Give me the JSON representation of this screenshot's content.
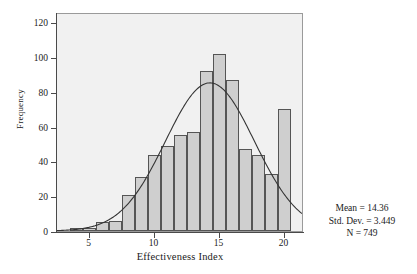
{
  "chart_data": {
    "type": "bar",
    "title": "",
    "subtitle": "",
    "xlabel": "Effectiveness Index",
    "ylabel": "Frequency",
    "xlim": [
      2.5,
      21.5
    ],
    "ylim": [
      0,
      126
    ],
    "grid": false,
    "legend": null,
    "bin_width": 1,
    "categories": [
      4,
      5,
      6,
      7,
      8,
      9,
      10,
      11,
      12,
      13,
      14,
      15,
      16,
      17,
      18,
      19,
      20
    ],
    "values": [
      2,
      2,
      5,
      6,
      21,
      31,
      44,
      49,
      55,
      57,
      92,
      102,
      87,
      47,
      44,
      33,
      70
    ],
    "xticks": [
      5,
      10,
      15,
      20
    ],
    "yticks": [
      0,
      20,
      40,
      60,
      80,
      100,
      120
    ],
    "overlay": {
      "type": "line",
      "name": "normal-curve",
      "mean": 14.36,
      "std_dev": 3.449,
      "n": 749,
      "peak_value": 86
    },
    "annotations": [
      "Mean = 14.36",
      "Std. Dev. = 3.449",
      "N = 749"
    ]
  },
  "stats": {
    "mean_label": "Mean = 14.36",
    "std_label": "Std. Dev. = 3.449",
    "n_label": "N = 749"
  },
  "colors": {
    "bar_fill": "#cfcfcf",
    "bar_stroke": "#555555",
    "plot_background": "#f1f1f1",
    "curve": "#333333",
    "axis": "#4a4a4a",
    "text": "#1a1a1a"
  }
}
